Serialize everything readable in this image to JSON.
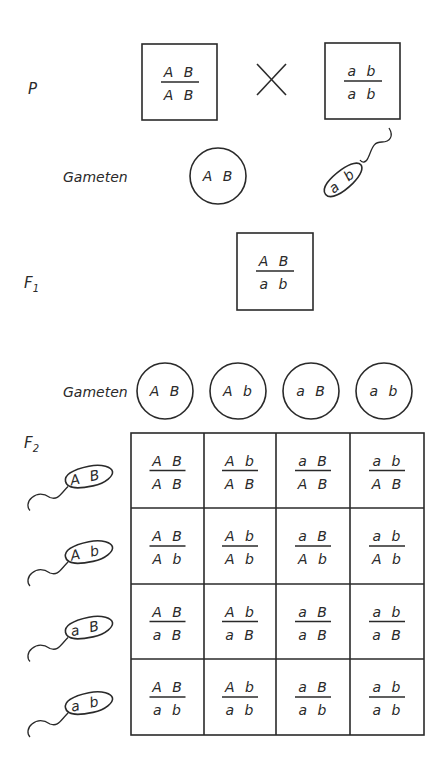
{
  "generations": {
    "p": "P",
    "f1_main": "F",
    "f1_sub": "1",
    "f2_main": "F",
    "f2_sub": "2"
  },
  "labels": {
    "gametes_1": "Gameten",
    "gametes_2": "Gameten",
    "cross_symbol": "×"
  },
  "parents": [
    {
      "top": "A B",
      "bottom": "A B"
    },
    {
      "top": "a b",
      "bottom": "a b"
    }
  ],
  "parent_gametes": {
    "egg": "A B",
    "sperm": "a b"
  },
  "f1": {
    "top": "A B",
    "bottom": "a b"
  },
  "f1_egg_gametes": [
    "A B",
    "A b",
    "a B",
    "a b"
  ],
  "f1_sperm_gametes": [
    "A B",
    "A b",
    "a B",
    "a b"
  ],
  "punnett": [
    [
      {
        "top": "A B",
        "bottom": "A B"
      },
      {
        "top": "A b",
        "bottom": "A B"
      },
      {
        "top": "a B",
        "bottom": "A B"
      },
      {
        "top": "a b",
        "bottom": "A B"
      }
    ],
    [
      {
        "top": "A B",
        "bottom": "A b"
      },
      {
        "top": "A b",
        "bottom": "A b"
      },
      {
        "top": "a B",
        "bottom": "A b"
      },
      {
        "top": "a b",
        "bottom": "A b"
      }
    ],
    [
      {
        "top": "A B",
        "bottom": "a B"
      },
      {
        "top": "A b",
        "bottom": "a B"
      },
      {
        "top": "a B",
        "bottom": "a B"
      },
      {
        "top": "a b",
        "bottom": "a B"
      }
    ],
    [
      {
        "top": "A B",
        "bottom": "a b"
      },
      {
        "top": "A b",
        "bottom": "a b"
      },
      {
        "top": "a B",
        "bottom": "a b"
      },
      {
        "top": "a b",
        "bottom": "a b"
      }
    ]
  ]
}
